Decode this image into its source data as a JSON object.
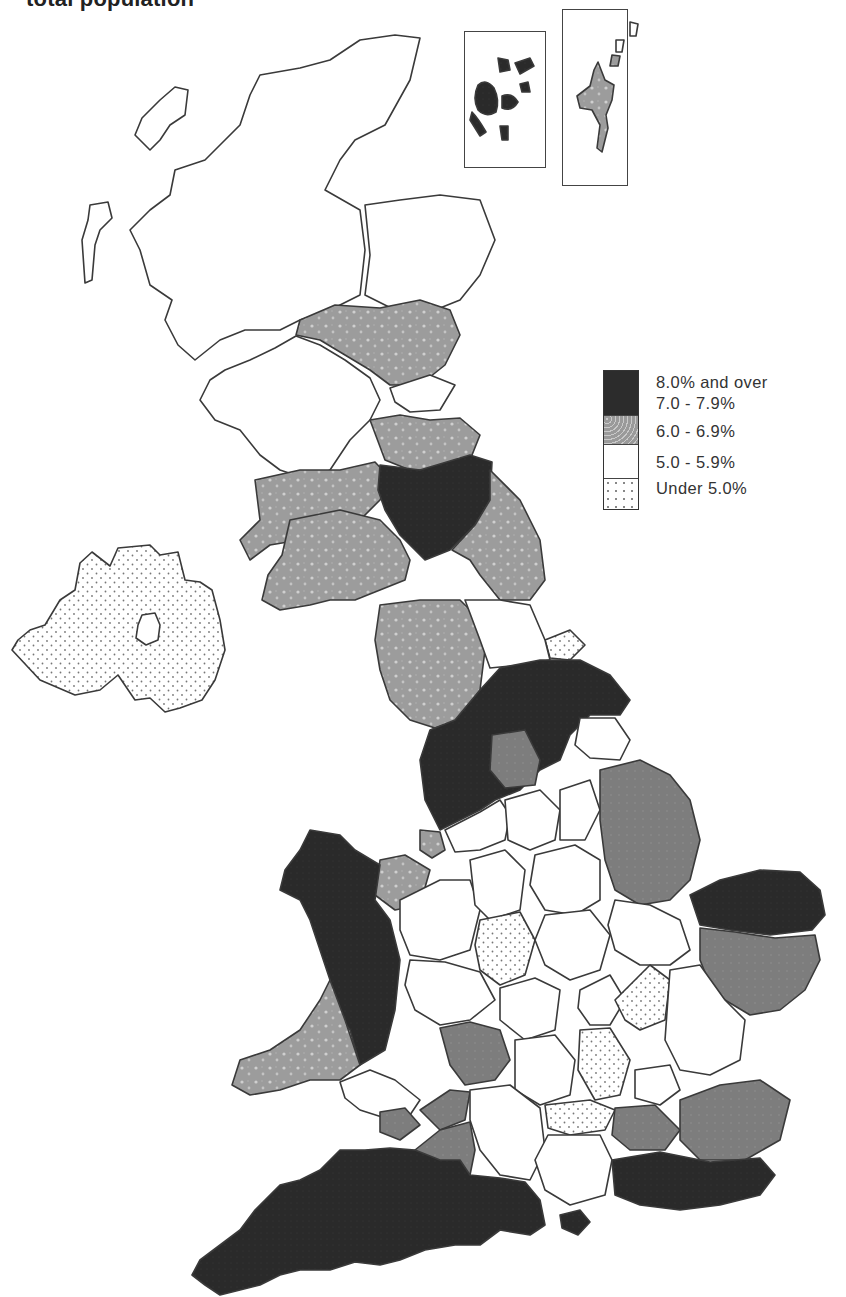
{
  "title": "total population",
  "legend": {
    "items": [
      {
        "label": "8.0% and over",
        "fill": "#2b2b2b",
        "pattern": "solid-dark"
      },
      {
        "label": "7.0 - 7.9%",
        "fill": "#3a3a3a",
        "pattern": "solid-dark"
      },
      {
        "label": "6.0 - 6.9%",
        "fill": "#9a9a9a",
        "pattern": "mottled-grey"
      },
      {
        "label": "5.0 - 5.9%",
        "fill": "#ffffff",
        "pattern": "blank"
      },
      {
        "label": "Under 5.0%",
        "fill": "#f6f6f6",
        "pattern": "dotted"
      }
    ]
  },
  "colors": {
    "category_8_plus": "#2b2b2b",
    "category_7_to_7_9": "#3a3a3a",
    "category_6_to_6_9": "#9a9a9a",
    "category_5_to_5_9": "#ffffff",
    "category_under_5": "#f6f6f6",
    "outline": "#3a3a3a"
  },
  "map": {
    "insets": [
      {
        "name": "orkney-inset",
        "category": "7.0 - 7.9% / 8.0% and over"
      },
      {
        "name": "shetland-inset",
        "category": "6.0 - 6.9%"
      }
    ]
  }
}
